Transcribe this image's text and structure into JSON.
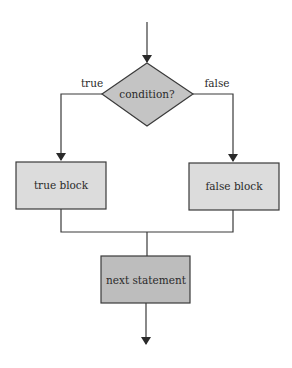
{
  "diagram": {
    "type": "flowchart",
    "colors": {
      "decision_fill": "#c4c4c4",
      "block_fill": "#dcdcdc",
      "next_fill": "#bdbdbd",
      "stroke": "#3a3a3a",
      "background": "#ffffff"
    },
    "nodes": {
      "condition": {
        "label": "condition?",
        "shape": "diamond"
      },
      "true_block": {
        "label": "true block",
        "shape": "rectangle"
      },
      "false_block": {
        "label": "false block",
        "shape": "rectangle"
      },
      "next_statement": {
        "label": "next statement",
        "shape": "rectangle"
      }
    },
    "edges": {
      "entry": {
        "from": "start",
        "to": "condition",
        "label": ""
      },
      "true_branch": {
        "from": "condition",
        "to": "true_block",
        "label": "true"
      },
      "false_branch": {
        "from": "condition",
        "to": "false_block",
        "label": "false"
      },
      "true_merge": {
        "from": "true_block",
        "to": "next_statement",
        "label": ""
      },
      "false_merge": {
        "from": "false_block",
        "to": "next_statement",
        "label": ""
      },
      "exit": {
        "from": "next_statement",
        "to": "end",
        "label": ""
      }
    }
  }
}
